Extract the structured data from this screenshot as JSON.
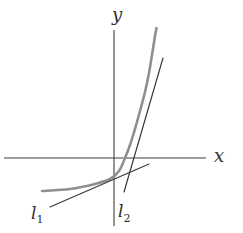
{
  "figure": {
    "background": "#ffffff",
    "axis_color": "#3f3f3f",
    "curve_color": "#8f8f8f",
    "tangent_color": "#3a3a3a",
    "labels": {
      "x_axis": "x",
      "y_axis": "y",
      "tangent1_letter": "l",
      "tangent1_sub": "1",
      "tangent2_letter": "l",
      "tangent2_sub": "2"
    },
    "geometry": {
      "x_axis": {
        "x1": 4,
        "y1": 158,
        "x2": 206,
        "y2": 158
      },
      "y_axis": {
        "x1": 114,
        "y1": 30,
        "x2": 114,
        "y2": 226
      },
      "curve_points": [
        [
          42,
          191
        ],
        [
          70,
          189
        ],
        [
          95,
          184
        ],
        [
          110,
          179
        ],
        [
          119,
          171
        ],
        [
          125,
          158
        ],
        [
          130,
          145
        ],
        [
          135,
          129
        ],
        [
          140,
          111
        ],
        [
          145,
          92
        ],
        [
          149,
          73
        ],
        [
          152,
          55
        ],
        [
          155,
          36
        ],
        [
          156.5,
          28
        ]
      ],
      "tangent1": {
        "x1": 50,
        "y1": 207,
        "x2": 149,
        "y2": 164
      },
      "tangent2": {
        "x1": 124,
        "y1": 192,
        "x2": 163,
        "y2": 58
      }
    }
  }
}
